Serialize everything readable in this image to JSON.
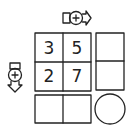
{
  "puzzle": {
    "grid": [
      [
        "3",
        "5"
      ],
      [
        "2",
        "7"
      ]
    ],
    "right_column": [
      "",
      ""
    ],
    "bottom_row": [
      "",
      ""
    ],
    "corner_shape": "circle",
    "operators": {
      "top": {
        "symbol": "+",
        "direction": "right",
        "icon": "add-arrow-right-icon"
      },
      "left": {
        "symbol": "+",
        "direction": "down",
        "icon": "add-arrow-down-icon"
      }
    }
  },
  "colors": {
    "stroke": "#222222",
    "background": "#ffffff"
  }
}
